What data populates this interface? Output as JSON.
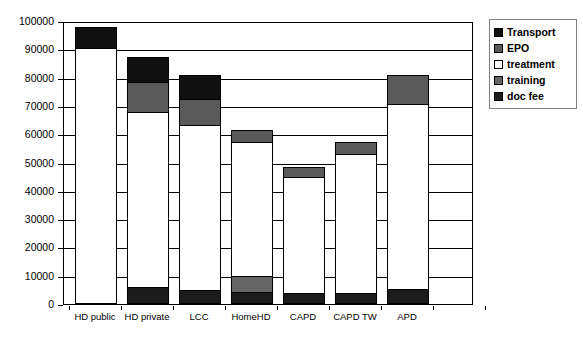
{
  "chart_data": {
    "type": "bar",
    "subtype": "stacked-bar",
    "title": "",
    "xlabel": "",
    "ylabel": "",
    "ylim": [
      0,
      100000
    ],
    "ytick_step": 10000,
    "yticks": [
      0,
      10000,
      20000,
      30000,
      40000,
      50000,
      60000,
      70000,
      80000,
      90000,
      100000
    ],
    "ytick_labels": [
      "0",
      "10000",
      "20000",
      "30000",
      "40000",
      "50000",
      "60000",
      "70000",
      "80000",
      "90000",
      "100000"
    ],
    "grid": true,
    "legend_position": "right-top",
    "categories": [
      "HD public",
      "HD private",
      "LCC",
      "HomeHD",
      "CAPD",
      "CAPD TW",
      "APD"
    ],
    "stack_order_bottom_to_top": [
      "doc fee",
      "training",
      "treatment",
      "EPO",
      "Transport"
    ],
    "series": [
      {
        "name": "doc fee",
        "color": "#1c1c1c",
        "values": [
          0,
          5500,
          4500,
          4000,
          3700,
          3700,
          4800
        ]
      },
      {
        "name": "training",
        "color": "#666666",
        "values": [
          0,
          0,
          0,
          5500,
          0,
          0,
          0
        ]
      },
      {
        "name": "treatment",
        "color": "#ffffff",
        "values": [
          90000,
          62000,
          58500,
          47500,
          40800,
          48800,
          65500
        ]
      },
      {
        "name": "EPO",
        "color": "#5a5a5a",
        "values": [
          0,
          10500,
          9000,
          4000,
          3700,
          4500,
          10200
        ]
      },
      {
        "name": "Transport",
        "color": "#101010",
        "values": [
          7500,
          9000,
          8500,
          0,
          0,
          0,
          0
        ]
      }
    ],
    "totals": [
      97500,
      87000,
      80500,
      61000,
      48200,
      57000,
      80500
    ],
    "legend_entries": [
      {
        "label": "Transport",
        "color": "#101010"
      },
      {
        "label": "EPO",
        "color": "#5a5a5a"
      },
      {
        "label": "treatment",
        "color": "#ffffff"
      },
      {
        "label": "training",
        "color": "#666666"
      },
      {
        "label": "doc fee",
        "color": "#1c1c1c"
      }
    ]
  }
}
